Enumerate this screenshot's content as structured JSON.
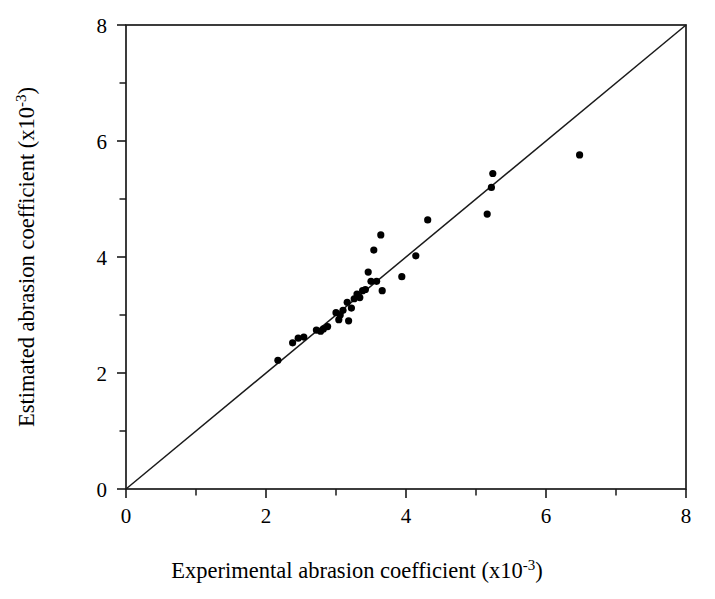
{
  "chart_data": {
    "type": "scatter",
    "title": "",
    "xlabel": "Experimental abrasion coefficient (x10-3)",
    "ylabel": "Estimated abrasion coefficient (x10-3)",
    "xlabel_parts": {
      "text": "Experimental abrasion coefficient (x10",
      "sup": "-3",
      "tail": ")"
    },
    "ylabel_parts": {
      "text": "Estimated abrasion coefficient (x10",
      "sup": "-3",
      "tail": ")"
    },
    "xlim": [
      0,
      8
    ],
    "ylim": [
      0,
      8
    ],
    "xticks": [
      0,
      2,
      4,
      6,
      8
    ],
    "yticks": [
      0,
      2,
      4,
      6,
      8
    ],
    "xticklabels": [
      "0",
      "2",
      "4",
      "6",
      "8"
    ],
    "yticklabels": [
      "0",
      "2",
      "4",
      "6",
      "8"
    ],
    "xminorticks": [
      1,
      3,
      5,
      7
    ],
    "yminorticks": [
      1,
      3,
      5,
      7
    ],
    "grid": false,
    "legend": false,
    "tick_direction": "out",
    "marker": "filled-circle",
    "marker_color": "#000000",
    "marker_size_px": 7.2,
    "reference_line": {
      "name": "identity-line",
      "kind": "1:1 parity line",
      "from": [
        0,
        0
      ],
      "to": [
        8,
        8
      ],
      "color": "#1a1a1a"
    },
    "series": [
      {
        "name": "Estimated vs experimental abrasion coefficient",
        "points": [
          [
            2.17,
            2.22
          ],
          [
            2.38,
            2.52
          ],
          [
            2.46,
            2.6
          ],
          [
            2.54,
            2.62
          ],
          [
            2.72,
            2.74
          ],
          [
            2.78,
            2.72
          ],
          [
            2.82,
            2.76
          ],
          [
            2.88,
            2.8
          ],
          [
            3.0,
            3.04
          ],
          [
            3.04,
            2.92
          ],
          [
            3.06,
            3.0
          ],
          [
            3.1,
            3.08
          ],
          [
            3.16,
            3.22
          ],
          [
            3.18,
            2.9
          ],
          [
            3.22,
            3.12
          ],
          [
            3.26,
            3.28
          ],
          [
            3.3,
            3.36
          ],
          [
            3.34,
            3.3
          ],
          [
            3.38,
            3.42
          ],
          [
            3.42,
            3.44
          ],
          [
            3.46,
            3.74
          ],
          [
            3.5,
            3.58
          ],
          [
            3.54,
            4.12
          ],
          [
            3.58,
            3.58
          ],
          [
            3.64,
            4.38
          ],
          [
            3.66,
            3.42
          ],
          [
            3.94,
            3.66
          ],
          [
            4.14,
            4.02
          ],
          [
            4.31,
            4.64
          ],
          [
            5.16,
            4.74
          ],
          [
            5.22,
            5.2
          ],
          [
            5.24,
            5.44
          ],
          [
            6.48,
            5.76
          ]
        ]
      }
    ]
  },
  "figure": {
    "background_color": "#ffffff",
    "foreground_color": "#000000"
  }
}
